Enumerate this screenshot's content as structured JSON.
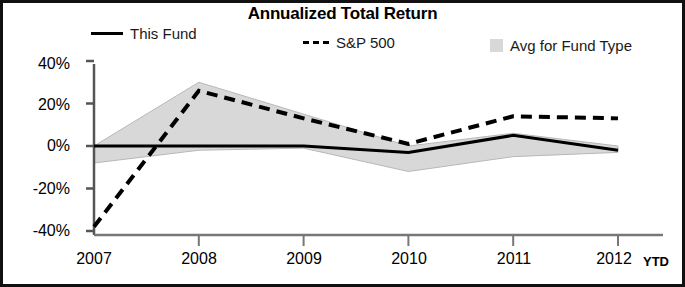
{
  "chart": {
    "title": "Annualized Total Return",
    "ytd_note": "YTD"
  },
  "legend": {
    "items": [
      {
        "label": "This Fund",
        "marker": "solid-line-swatch",
        "color": "#000000"
      },
      {
        "label": "S&P 500",
        "marker": "dashed-line-swatch",
        "color": "#000000"
      },
      {
        "label": "Avg for Fund Type",
        "marker": "gray-band-swatch",
        "color": "#d8d8d8"
      }
    ]
  },
  "axes": {
    "y_ticks": [
      "40%",
      "20%",
      "0%",
      "-20%",
      "-40%"
    ],
    "x_ticks": [
      "2007",
      "2008",
      "2009",
      "2010",
      "2011",
      "2012"
    ]
  },
  "chart_data": {
    "type": "line",
    "title": "Annualized Total Return",
    "xlabel": "",
    "ylabel": "",
    "x": [
      "2007",
      "2008",
      "2009",
      "2010",
      "2011",
      "2012"
    ],
    "ylim": [
      -40,
      40
    ],
    "xlim": [
      "2007",
      "2012"
    ],
    "grid": false,
    "legend_position": "top",
    "y_tick_values": [
      40,
      20,
      0,
      -20,
      -40
    ],
    "y_tick_labels": [
      "40%",
      "20%",
      "0%",
      "-20%",
      "-40%"
    ],
    "annotations": [
      "YTD"
    ],
    "series": [
      {
        "name": "This Fund",
        "style": "solid",
        "color": "#000000",
        "values": [
          0,
          0,
          0,
          -3,
          5,
          -2
        ]
      },
      {
        "name": "S&P 500",
        "style": "dashed",
        "color": "#000000",
        "values": [
          -38,
          26,
          13,
          1,
          14,
          13
        ]
      },
      {
        "name": "Avg for Fund Type",
        "style": "band",
        "color": "#d8d8d8",
        "band_upper": [
          0,
          30,
          15,
          0,
          6,
          0
        ],
        "band_lower": [
          -8,
          -2,
          -1,
          -12,
          -5,
          -3
        ]
      }
    ]
  }
}
